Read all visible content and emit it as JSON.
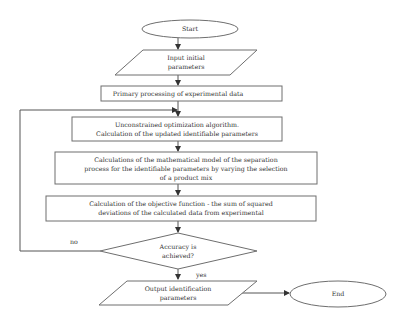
{
  "diagram": {
    "type": "flowchart",
    "nodes": {
      "start": {
        "shape": "ellipse",
        "label": "Start"
      },
      "input": {
        "shape": "parallelogram",
        "lines": [
          "Input initial",
          "parameters"
        ]
      },
      "primary": {
        "shape": "rectangle",
        "lines": [
          "Primary processing of experimental data"
        ]
      },
      "optimization": {
        "shape": "rectangle",
        "lines": [
          "Unconstrained optimization algorithm.",
          "Calculation of the updated identifiable parameters"
        ]
      },
      "model": {
        "shape": "rectangle",
        "lines": [
          "Calculations of the mathematical model of the separation",
          "process for the identifiable parameters by varying the selection",
          "of a product mix"
        ]
      },
      "objective": {
        "shape": "rectangle",
        "lines": [
          "Calculation of the objective function - the sum of squared",
          "deviations of the calculated data from experimental"
        ]
      },
      "decision": {
        "shape": "diamond",
        "lines": [
          "Accuracy is",
          "achieved?"
        ]
      },
      "output": {
        "shape": "parallelogram",
        "lines": [
          "Output identification",
          "parameters"
        ]
      },
      "end": {
        "shape": "ellipse",
        "label": "End"
      }
    },
    "edges": {
      "no_label": "no",
      "yes_label": "yes"
    }
  }
}
